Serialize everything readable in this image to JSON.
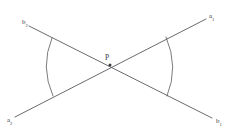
{
  "figure": {
    "type": "geometry-diagram",
    "background_color": "#ffffff",
    "stroke_color": "#59595f",
    "text_color": "#3a3a40",
    "width": 239,
    "height": 137,
    "vertex": {
      "label": "P",
      "sublabel": "",
      "x": 110,
      "y": 65
    },
    "rays": [
      {
        "name": "ray-top-left",
        "base": "b",
        "subscript": "2",
        "label": "b2",
        "label_x": 22,
        "label_y": 24,
        "end_x": 29,
        "end_y": 26
      },
      {
        "name": "ray-top-right",
        "base": "a",
        "subscript": "1",
        "label": "a1",
        "label_x": 209,
        "label_y": 18,
        "end_x": 206,
        "end_y": 19
      },
      {
        "name": "ray-bottom-left",
        "base": "a",
        "subscript": "2",
        "label": "a2",
        "label_x": 7,
        "label_y": 122,
        "end_x": 15,
        "end_y": 117
      },
      {
        "name": "ray-bottom-right",
        "base": "b",
        "subscript": "1",
        "label": "b1",
        "label_x": 216,
        "label_y": 123,
        "end_x": 212,
        "end_y": 118
      }
    ],
    "arcs": [
      {
        "name": "left-angle-arc",
        "side": "left",
        "start_x": 52,
        "start_y": 38,
        "end_x": 53,
        "end_y": 96,
        "radius": 62
      },
      {
        "name": "right-angle-arc",
        "side": "right",
        "start_x": 166,
        "start_y": 37,
        "end_x": 167,
        "end_y": 96,
        "radius": 62
      }
    ]
  }
}
